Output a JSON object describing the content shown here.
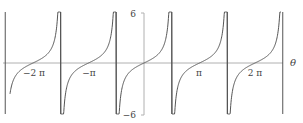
{
  "chart_data": {
    "type": "line",
    "title": "",
    "function": "tan(theta)",
    "xlabel": "θ",
    "ylabel": "",
    "xlim": [
      -7.95,
      7.95
    ],
    "ylim": [
      -6,
      6
    ],
    "grid": false,
    "legend": null,
    "x_tick_labels": [
      "−2 π",
      "−π",
      "π",
      "2 π"
    ],
    "x_tick_values": [
      -6.2832,
      -3.1416,
      3.1416,
      6.2832
    ],
    "y_tick_labels": [
      "6",
      "−6"
    ],
    "y_tick_values": [
      6,
      -6
    ],
    "vertical_asymptotes": [
      -7.854,
      -4.712,
      -1.571,
      1.571,
      4.712,
      7.854
    ],
    "series": [
      {
        "name": "tan θ",
        "color": "#555555",
        "x": [
          -7.5,
          -7.0,
          -6.5,
          -6.2832,
          -6.0,
          -5.5,
          -5.0
        ],
        "values": [
          -2.71,
          -0.87,
          -0.22,
          0,
          0.29,
          1.0,
          3.38
        ]
      }
    ]
  },
  "colors": {
    "curve": "#555555",
    "axis": "#aaaaaa"
  }
}
